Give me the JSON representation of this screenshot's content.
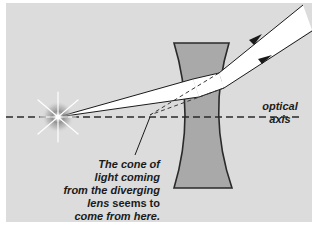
{
  "diagram": {
    "type": "optics-ray-diagram",
    "colors": {
      "background_panel": "#dcdcdc",
      "lens_fill": "#a9a9a9",
      "lens_stroke": "#2a2a2a",
      "beam_fill": "#ffffff",
      "ray_stroke": "#1a1a1a",
      "axis_stroke": "#2a2a2a",
      "text": "#1a1a1a"
    },
    "labels": {
      "axis_line1": "optical",
      "axis_line2": "axis",
      "caption_line1": "The cone of",
      "caption_line2": "light coming",
      "caption_line3": "from the diverging",
      "caption_line4_italic": "lens",
      "caption_line4_upright": " seems to",
      "caption_line5": "come from here."
    },
    "elements": [
      {
        "id": "light-source",
        "kind": "starburst point source",
        "position": [
          58,
          117
        ]
      },
      {
        "id": "optical-axis",
        "kind": "dashed horizontal line",
        "y": 117
      },
      {
        "id": "diverging-lens",
        "kind": "concave lens",
        "top_y": 43,
        "bottom_y": 188
      },
      {
        "id": "incident-beam",
        "kind": "narrow cone of rays from source to lens"
      },
      {
        "id": "refracted-beam",
        "kind": "diverging rays exiting lens with arrows"
      },
      {
        "id": "virtual-ray-extensions",
        "kind": "dashed back-projected rays meeting at virtual image"
      },
      {
        "id": "leader-line",
        "kind": "pointer from caption to virtual origin"
      }
    ]
  }
}
